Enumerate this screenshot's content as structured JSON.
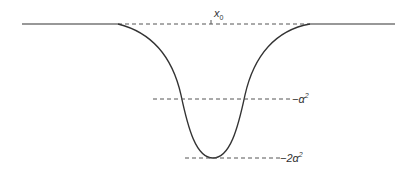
{
  "diagram": {
    "type": "potential-well-curve",
    "colors": {
      "curve": "#333333",
      "dashed": "#555555",
      "background": "#ffffff"
    },
    "labels": {
      "x0": {
        "base": "x",
        "sub": "0"
      },
      "alpha_sq": {
        "prefix": "−α",
        "sup": "2"
      },
      "two_alpha_sq": {
        "prefix": "−2α",
        "sup": "2"
      }
    },
    "levels": [
      "0",
      "-alpha^2",
      "-2alpha^2"
    ]
  }
}
